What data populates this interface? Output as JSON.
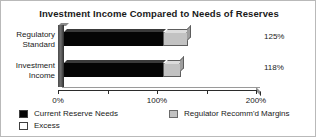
{
  "chart_data": {
    "type": "bar",
    "orientation": "horizontal",
    "stacked": true,
    "title": "Investment Income Compared to Needs of Reserves",
    "xlabel": "",
    "ylabel": "",
    "categories": [
      "Regulatory Standard",
      "Investment Income"
    ],
    "category_lines": [
      [
        "Regulatory",
        "Standard"
      ],
      [
        "Investment",
        "Income"
      ]
    ],
    "series": [
      {
        "name": "Current Reserve Needs",
        "values": [
          100,
          100
        ],
        "color": "#050505"
      },
      {
        "name": "Regulator Recomm'd Margins",
        "values": [
          25,
          18
        ],
        "color": "#c2c2c2"
      },
      {
        "name": "Excess",
        "values": [
          0,
          0
        ],
        "color": "#ffffff"
      }
    ],
    "totals": [
      125,
      118
    ],
    "value_labels": [
      "125%",
      "118%"
    ],
    "xlim": [
      0,
      200
    ],
    "xticks": [
      0,
      50,
      100,
      150,
      200
    ],
    "xtick_labels": [
      "0%",
      "",
      "100%",
      "",
      "200%"
    ],
    "grid": false,
    "legend_position": "bottom",
    "legend": [
      {
        "label": "Current Reserve Needs",
        "swatch": "black"
      },
      {
        "label": "Excess",
        "swatch": "white"
      },
      {
        "label": "Regulator Recomm'd Margins",
        "swatch": "gray"
      }
    ],
    "style": {
      "three_d": true,
      "background": "#ffffff",
      "border_color": "#b9b9b9",
      "text_color": "#1a1a1a"
    }
  }
}
